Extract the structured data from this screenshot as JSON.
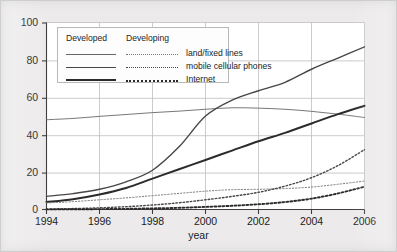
{
  "chart_data": {
    "type": "line",
    "title": "",
    "xlabel": "year",
    "ylabel": "",
    "xlim": [
      1994,
      2006
    ],
    "ylim": [
      0,
      100
    ],
    "grid": true,
    "legend_position": "upper-left",
    "legend_column_headers": [
      "Developed",
      "Developing"
    ],
    "xticks": [
      "1994",
      "1996",
      "1998",
      "2000",
      "2002",
      "2004",
      "2006"
    ],
    "yticks": [
      "0",
      "20",
      "40",
      "60",
      "80",
      "100"
    ],
    "x": [
      1994,
      1995,
      1996,
      1997,
      1998,
      1999,
      2000,
      2001,
      2002,
      2003,
      2004,
      2005,
      2006
    ],
    "series": [
      {
        "name": "land/fixed lines",
        "group": "Developed",
        "style": "solid-thin",
        "color": "#6a6666",
        "values": [
          48,
          48.7,
          49.8,
          50.8,
          51.8,
          52.6,
          53.6,
          54.4,
          54.2,
          53.6,
          52.5,
          51.0,
          49.2
        ]
      },
      {
        "name": "mobile cellular phones",
        "group": "Developed",
        "style": "solid-medium",
        "color": "#4a4646",
        "values": [
          7.0,
          8.5,
          10.8,
          14.8,
          21.0,
          33.5,
          50.0,
          58.5,
          63.5,
          68.0,
          75.0,
          81.0,
          87.0
        ]
      },
      {
        "name": "Internet",
        "group": "Developed",
        "style": "solid-thick",
        "color": "#2d2a2a",
        "values": [
          4.0,
          5.5,
          8.0,
          11.5,
          16.5,
          21.5,
          26.5,
          31.5,
          36.5,
          41.0,
          46.0,
          51.0,
          55.5
        ]
      },
      {
        "name": "land/fixed lines",
        "group": "Developing",
        "style": "dotted-thin",
        "color": "#7a7676",
        "values": [
          3.5,
          4.2,
          5.2,
          6.2,
          7.4,
          8.6,
          9.8,
          10.6,
          10.8,
          11.2,
          12.0,
          13.5,
          15.2
        ]
      },
      {
        "name": "mobile cellular phones",
        "group": "Developing",
        "style": "dotted-medium",
        "color": "#4a4646",
        "values": [
          0.3,
          0.5,
          0.9,
          1.5,
          2.4,
          3.6,
          5.2,
          7.0,
          9.2,
          12.5,
          17.0,
          23.5,
          32.0
        ]
      },
      {
        "name": "Internet",
        "group": "Developing",
        "style": "dotted-thick",
        "color": "#2d2a2a",
        "values": [
          0.05,
          0.1,
          0.2,
          0.35,
          0.6,
          0.9,
          1.4,
          2.0,
          2.8,
          4.0,
          5.8,
          8.6,
          12.2
        ]
      }
    ]
  },
  "legend": {
    "headers": {
      "developed": "Developed",
      "developing": "Developing"
    },
    "rows": [
      {
        "label": "land/fixed lines"
      },
      {
        "label": "mobile cellular phones"
      },
      {
        "label": "Internet"
      }
    ]
  },
  "axes": {
    "x_title": "year",
    "x_ticks": [
      "1994",
      "1996",
      "1998",
      "2000",
      "2002",
      "2004",
      "2006"
    ],
    "y_ticks": [
      "100",
      "80",
      "60",
      "40",
      "20",
      "0"
    ]
  },
  "colors": {
    "background": "#eceaea",
    "plot_background": "#ffffff",
    "grid": "#b9b7b7",
    "axis": "#4a4646",
    "text": "#201d1d",
    "line_thin": "#6a6666",
    "line_medium": "#4a4646",
    "line_thick": "#2d2a2a"
  }
}
